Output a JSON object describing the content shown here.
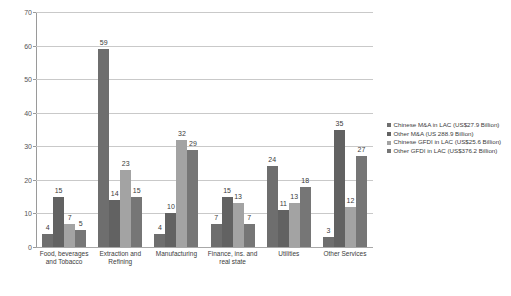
{
  "chart_data": {
    "type": "bar",
    "title": "",
    "subtitle": "",
    "xlabel": "",
    "ylabel": "",
    "ylim": [
      0,
      70
    ],
    "ytick_step": 10,
    "yticks": [
      0,
      10,
      20,
      30,
      40,
      50,
      60,
      70
    ],
    "grid": true,
    "legend_position": "right",
    "grouping": "grouped",
    "categories": [
      "Food, beverages and Tobacco",
      "Extraction and Refining",
      "Manufacturing",
      "Finance, ins. and real state",
      "Utilities",
      "Other Services"
    ],
    "series": [
      {
        "name": "Chinese M&A in LAC (US$27.9 Billion)",
        "color": "#6e6e6e",
        "values": [
          4,
          59,
          4,
          7,
          24,
          3
        ]
      },
      {
        "name": "Other M&A (US 288.9 Billion)",
        "color": "#626262",
        "values": [
          15,
          14,
          10,
          15,
          11,
          35
        ]
      },
      {
        "name": "Chinese GFDI in LAC (US$25.6 Billion)",
        "color": "#a3a3a3",
        "values": [
          7,
          23,
          32,
          13,
          13,
          12
        ]
      },
      {
        "name": "Other GFDI in LAC (US$376.2 Billion)",
        "color": "#767676",
        "values": [
          5,
          15,
          29,
          7,
          18,
          27
        ]
      }
    ]
  },
  "axis": {
    "y_tick_labels": [
      "70",
      "60",
      "50",
      "40",
      "30",
      "20",
      "10",
      "0"
    ]
  },
  "legend": {
    "items": [
      {
        "label": "Chinese M&A in LAC (US$27.9 Billion)",
        "color": "#6e6e6e"
      },
      {
        "label": "Other M&A (US 288.9 Billion)",
        "color": "#626262"
      },
      {
        "label": "Chinese GFDI in LAC (US$25.6 Billion)",
        "color": "#a3a3a3"
      },
      {
        "label": "Other GFDI in LAC (US$376.2 Billion)",
        "color": "#767676"
      }
    ]
  },
  "colors": {
    "gridline": "#c9c9c9",
    "axis": "#9a9a9a",
    "label_text": "#3b3b3b",
    "tick_text": "#555555",
    "background": "#ffffff"
  }
}
